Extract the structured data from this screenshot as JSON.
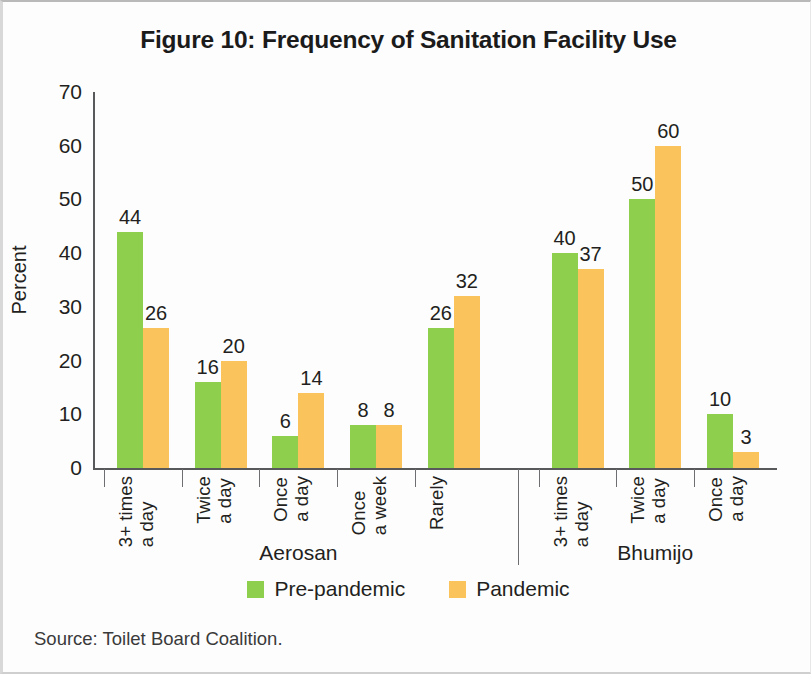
{
  "chart_data": {
    "type": "bar",
    "title": "Figure 10: Frequency of Sanitation Facility Use",
    "xlabel": "",
    "ylabel": "Percent",
    "ylim": [
      0,
      70
    ],
    "yticks": [
      0,
      10,
      20,
      30,
      40,
      50,
      60,
      70
    ],
    "grid": false,
    "legend_position": "bottom-center",
    "series": [
      {
        "name": "Pre-pandemic",
        "color": "#8ed04e",
        "values": [
          44,
          16,
          6,
          8,
          26,
          40,
          50,
          10
        ]
      },
      {
        "name": "Pandemic",
        "color": "#fbc35b",
        "values": [
          26,
          20,
          14,
          8,
          32,
          37,
          60,
          3
        ]
      }
    ],
    "categories": [
      "3+ times a day",
      "Twice a day",
      "Once a day",
      "Once a week",
      "Rarely",
      "3+ times a day",
      "Twice a day",
      "Once a day"
    ],
    "category_lines": [
      [
        "3+ times",
        "a day"
      ],
      [
        "Twice",
        "a day"
      ],
      [
        "Once",
        "a day"
      ],
      [
        "Once",
        "a week"
      ],
      [
        "Rarely",
        ""
      ],
      [
        "3+ times",
        "a day"
      ],
      [
        "Twice",
        "a day"
      ],
      [
        "Once",
        "a day"
      ]
    ],
    "groups": [
      {
        "name": "Aerosan",
        "categories": 5
      },
      {
        "name": "Bhumijo",
        "categories": 3
      }
    ],
    "source": "Source: Toilet Board Coalition."
  }
}
